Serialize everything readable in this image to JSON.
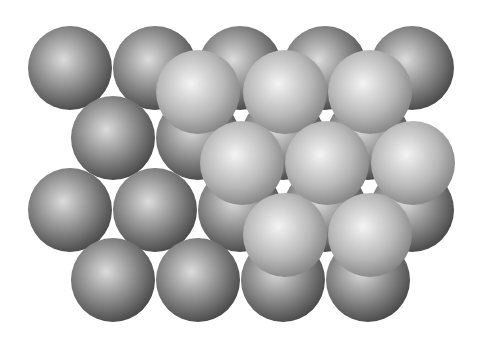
{
  "diagram": {
    "title": "",
    "colors": {
      "background": "#ffffff",
      "bottom_layer_light": "#d8d8d8",
      "bottom_layer_dark": "#4a4a4a",
      "top_layer_light": "#f2f2f2",
      "top_layer_dark": "#8a8a8a"
    },
    "radius": 42,
    "bottom_layer": [
      {
        "x": 70,
        "y": 68
      },
      {
        "x": 155,
        "y": 68
      },
      {
        "x": 240,
        "y": 68
      },
      {
        "x": 325,
        "y": 68
      },
      {
        "x": 412,
        "y": 68
      },
      {
        "x": 113,
        "y": 138
      },
      {
        "x": 198,
        "y": 138
      },
      {
        "x": 283,
        "y": 138
      },
      {
        "x": 368,
        "y": 138
      },
      {
        "x": 70,
        "y": 210
      },
      {
        "x": 155,
        "y": 210
      },
      {
        "x": 240,
        "y": 210
      },
      {
        "x": 325,
        "y": 210
      },
      {
        "x": 412,
        "y": 210
      },
      {
        "x": 113,
        "y": 280
      },
      {
        "x": 198,
        "y": 280
      },
      {
        "x": 283,
        "y": 280
      },
      {
        "x": 368,
        "y": 280
      }
    ],
    "top_layer": [
      {
        "x": 198,
        "y": 92
      },
      {
        "x": 285,
        "y": 92
      },
      {
        "x": 370,
        "y": 92
      },
      {
        "x": 242,
        "y": 163
      },
      {
        "x": 327,
        "y": 163
      },
      {
        "x": 413,
        "y": 163
      },
      {
        "x": 285,
        "y": 235
      },
      {
        "x": 370,
        "y": 235
      }
    ]
  }
}
